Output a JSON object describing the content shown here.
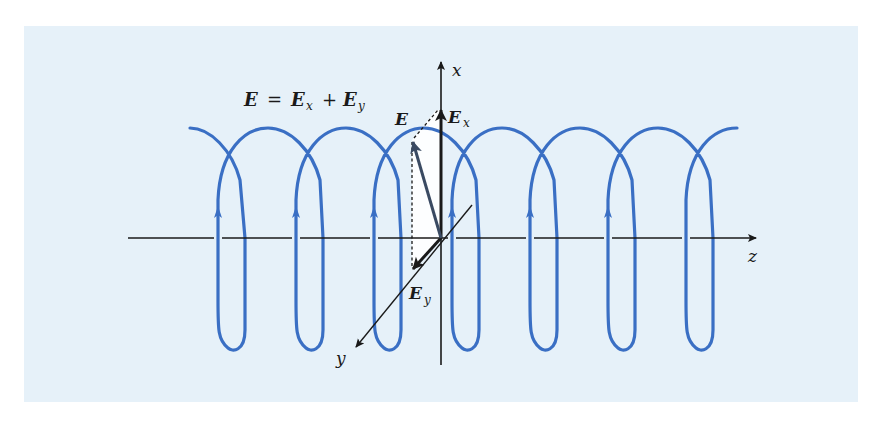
{
  "figure": {
    "equation": {
      "lhs": "E",
      "equals": "=",
      "term1": "E",
      "term1_sub": "x",
      "plus": "+",
      "term2": "E",
      "term2_sub": "y"
    },
    "axes": {
      "x_label": "x",
      "y_label": "y",
      "z_label": "z"
    },
    "vectors": {
      "E_label": "E",
      "Ex_label": "E",
      "Ex_sub": "x",
      "Ey_label": "E",
      "Ey_sub": "y"
    },
    "colors": {
      "background_panel": "#e6f1f9",
      "helix": "#3a6fc4",
      "axis": "#1a1a1a",
      "vector_E": "#3a4a62",
      "highlight_region": "#ffffff"
    },
    "helix": {
      "turns": 7,
      "direction_arrows": 6
    }
  }
}
